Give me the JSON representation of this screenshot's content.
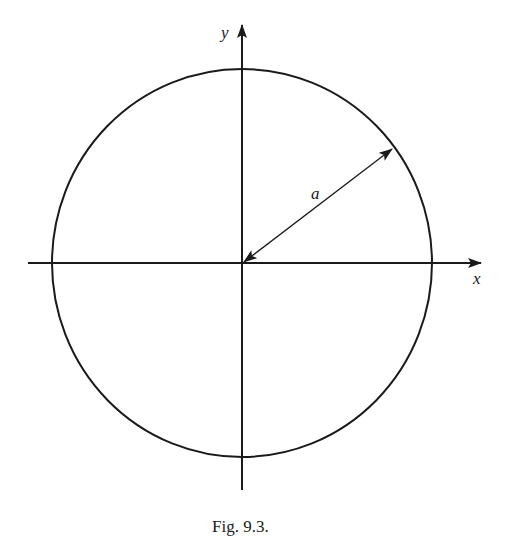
{
  "figure": {
    "caption": "Fig. 9.3.",
    "labels": {
      "x_axis": "x",
      "y_axis": "y",
      "radius": "a"
    },
    "elements": [
      {
        "type": "circle",
        "center": "origin",
        "radius_label": "a"
      },
      {
        "type": "axis",
        "name": "x",
        "direction": "right"
      },
      {
        "type": "axis",
        "name": "y",
        "direction": "up"
      },
      {
        "type": "double-arrow",
        "from": "origin",
        "to": "circle (upper-right)",
        "label": "a"
      }
    ]
  }
}
